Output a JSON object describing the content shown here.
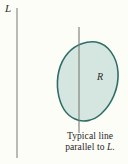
{
  "figure": {
    "background_color": "#fdfdf7",
    "labels": {
      "line_label": "L",
      "region_label": "R"
    },
    "caption": {
      "line1": "Typical line",
      "line2_prefix": "parallel to ",
      "line2_italic": "L",
      "line2_suffix": "."
    },
    "colors": {
      "region_fill": "#d5e6e1",
      "region_stroke": "#2f6e66",
      "line_stroke": "#7d7d78",
      "text": "#1f1f1f"
    },
    "geometry": {
      "axis_line": {
        "x": 17,
        "y_top": 8,
        "y_bottom": 158
      },
      "typical_line": {
        "x": 79,
        "y_top": 27,
        "y_bottom": 133
      },
      "region_bounds": {
        "left": 58,
        "top": 41,
        "right": 119,
        "bottom": 121
      }
    }
  }
}
